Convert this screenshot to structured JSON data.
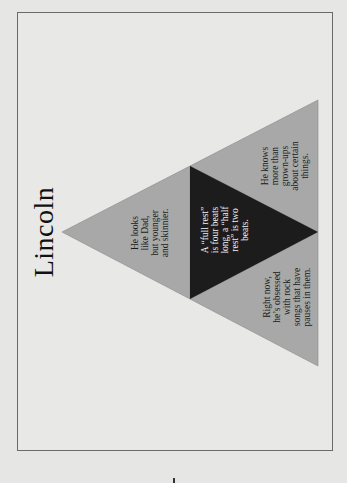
{
  "slide": {
    "title": "Lincoln",
    "orientation": "rotated-90-ccw"
  },
  "diagram": {
    "type": "triangle-pyramid",
    "colors": {
      "background": "#e8e8e6",
      "frame_border": "#6a6a6a",
      "outer_fill": "#a8a8a8",
      "center_fill": "#1c1c1c",
      "outer_text": "#1a1a1a",
      "center_text": "#f2f2f2"
    },
    "cells": {
      "top": {
        "position": "apex",
        "lines": [
          "He looks",
          "like Dad,",
          "but younger",
          "and skinnier."
        ]
      },
      "center": {
        "position": "center",
        "lines": [
          "A “full rest”",
          "is four beats",
          "long, a “half",
          "rest” is two",
          "beats."
        ]
      },
      "left": {
        "position": "bottom-left",
        "lines": [
          "He knows",
          "more than",
          "grown-ups",
          "about certain",
          "things."
        ]
      },
      "right": {
        "position": "bottom-right",
        "lines": [
          "Right now,",
          "he’s obsessed",
          "with rock",
          "songs that have",
          "pauses in them."
        ]
      }
    }
  }
}
